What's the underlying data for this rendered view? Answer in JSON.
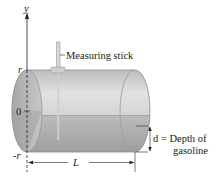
{
  "diagram": {
    "axis": {
      "label": "y"
    },
    "ticks": {
      "top": "r",
      "middle": "0",
      "bottom": "-r"
    },
    "measuring_stick_label": "Measuring stick",
    "length_label": "L",
    "depth_label_line1": "d = Depth of",
    "depth_label_line2": "gasoline",
    "colors": {
      "tank_upper": "#c9c9c9",
      "tank_lower": "#a9a9a9",
      "end_cap": "#b4b4b4",
      "outline": "#7a7a7a",
      "stroke": "#222222"
    }
  }
}
